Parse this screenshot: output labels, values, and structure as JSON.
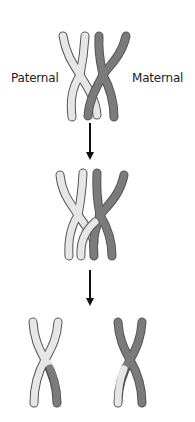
{
  "labels": {
    "paternal": "Paternal",
    "maternal": "Maternal"
  },
  "colors": {
    "paternal": "#e6e6e6",
    "maternal": "#7b7b7b",
    "outline": "#555555",
    "arrow": "#111111"
  },
  "stages": [
    {
      "name": "homologous-pair",
      "description": "Paternal and maternal chromosomes paired"
    },
    {
      "name": "crossing-over",
      "description": "Chromatids cross over and exchange segments"
    },
    {
      "name": "recombinant-chromosomes",
      "description": "Separated chromosomes with exchanged segments"
    }
  ]
}
